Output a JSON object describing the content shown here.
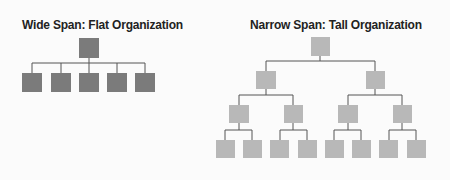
{
  "diagrams": [
    {
      "title": "Wide Span: Flat Organization",
      "box_color": "#7b7b7b",
      "line_color": "#555555",
      "levels": 2,
      "children_per_node": 5,
      "total_boxes": 6
    },
    {
      "title": "Narrow Span: Tall Organization",
      "box_color": "#b8b8b8",
      "line_color": "#555555",
      "levels": 4,
      "children_per_node": 2,
      "total_boxes": 15
    }
  ]
}
